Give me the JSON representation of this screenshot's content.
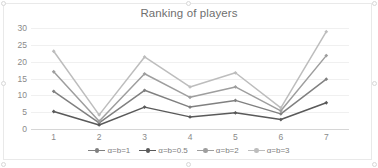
{
  "chart": {
    "title": "Ranking of players",
    "background_color": "#ffffff",
    "grid_color": "#f0f0f0",
    "axis_color": "#d6d6d6",
    "tick_label_color": "#8a8a8a",
    "title_color": "#6f6f6f"
  },
  "chart_data": {
    "type": "line",
    "title": "Ranking of players",
    "xlabel": "",
    "ylabel": "",
    "categories": [
      "1",
      "2",
      "3",
      "4",
      "5",
      "6",
      "7"
    ],
    "x_tick_labels": [
      "1",
      "2",
      "3",
      "4",
      "5",
      "6",
      "7"
    ],
    "y_tick_labels": [
      "0",
      "5",
      "10",
      "15",
      "20",
      "25",
      "30"
    ],
    "y_ticks": [
      0,
      5,
      10,
      15,
      20,
      25,
      30
    ],
    "ylim": [
      0,
      30
    ],
    "grid": "horizontal",
    "legend_position": "bottom",
    "markers": "diamond",
    "series": [
      {
        "name": "α=b=1",
        "color": "#808080",
        "values": [
          11.2,
          1.8,
          11.5,
          6.5,
          8.5,
          4.5,
          14.8
        ]
      },
      {
        "name": "α=b=0.5",
        "color": "#5a5a5a",
        "values": [
          5.2,
          1.2,
          6.5,
          3.6,
          4.8,
          2.8,
          7.8
        ]
      },
      {
        "name": "α=b=2",
        "color": "#9e9e9e",
        "values": [
          17.0,
          2.3,
          16.4,
          9.4,
          12.5,
          5.4,
          21.8
        ]
      },
      {
        "name": "α=b=3",
        "color": "#bdbdbd",
        "values": [
          23.1,
          4.2,
          21.4,
          12.5,
          16.7,
          6.3,
          28.9
        ]
      }
    ]
  },
  "legend": {
    "items": [
      {
        "label": "α=b=1",
        "color": "#808080"
      },
      {
        "label": "α=b=0.5",
        "color": "#5a5a5a"
      },
      {
        "label": "α=b=2",
        "color": "#9e9e9e"
      },
      {
        "label": "α=b=3",
        "color": "#bdbdbd"
      }
    ]
  }
}
